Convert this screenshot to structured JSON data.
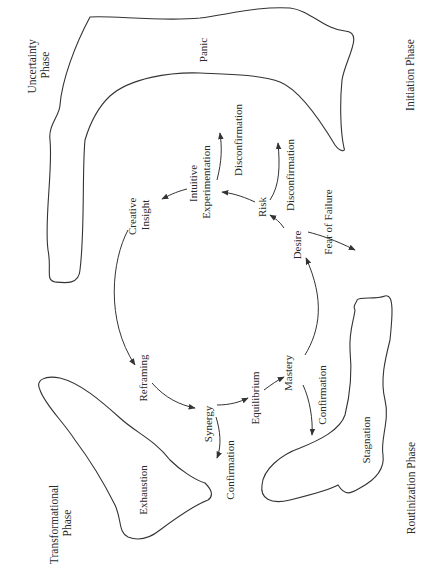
{
  "diagram": {
    "phases": {
      "uncertainty": [
        "Uncertainty",
        "Phase"
      ],
      "initiation": "Initiation Phase",
      "transformational": [
        "Transformational",
        "Phase"
      ],
      "routinization": "Routinization Phase"
    },
    "regions": {
      "panic": "Panic",
      "exhaustion": "Exhaustion",
      "stagnation": "Stagnation"
    },
    "cycle_nodes": {
      "creative_insight": [
        "Creative",
        "Insight"
      ],
      "intuitive_experimentation": [
        "Intuitive",
        "Experimentation"
      ],
      "risk": "Risk",
      "desire": "Desire",
      "mastery": "Mastery",
      "equilibrium": "Equilibrium",
      "synergy": "Synergy",
      "reframing": "Reframing"
    },
    "branches": {
      "disconfirmation_upper": "Disconfirmation",
      "disconfirmation_lower": "Disconfirmation",
      "fear_of_failure": "Fear of Failure",
      "confirmation_synergy": "Confirmation",
      "confirmation_mastery": "Confirmation"
    },
    "stroke_color": "#333333",
    "text_color": "#2a2a2a",
    "background": "#ffffff"
  }
}
